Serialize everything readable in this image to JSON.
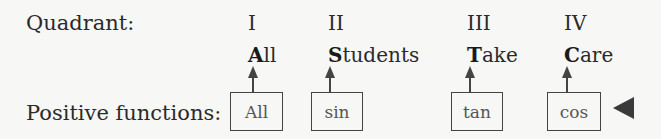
{
  "labels": {
    "quadrant": "Quadrant:",
    "positive_functions": "Positive functions:"
  },
  "quadrants": [
    {
      "numeral": "I",
      "word_initial": "A",
      "word_rest": "ll",
      "function": "All"
    },
    {
      "numeral": "II",
      "word_initial": "S",
      "word_rest": "tudents",
      "function": "sin"
    },
    {
      "numeral": "III",
      "word_initial": "T",
      "word_rest": "ake",
      "function": "tan"
    },
    {
      "numeral": "IV",
      "word_initial": "C",
      "word_rest": "are",
      "function": "cos"
    }
  ],
  "colors": {
    "stroke": "#444444",
    "text": "#2a2a2a"
  }
}
